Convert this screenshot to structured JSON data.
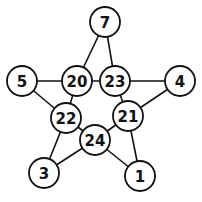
{
  "diagram": {
    "type": "star-graph",
    "nodes": [
      {
        "id": "n7",
        "label": "7",
        "x": 105,
        "y": 22,
        "r": 15
      },
      {
        "id": "n5",
        "label": "5",
        "x": 22,
        "y": 81,
        "r": 15
      },
      {
        "id": "n20",
        "label": "20",
        "x": 77,
        "y": 81,
        "r": 15
      },
      {
        "id": "n23",
        "label": "23",
        "x": 115,
        "y": 81,
        "r": 15
      },
      {
        "id": "n4",
        "label": "4",
        "x": 180,
        "y": 81,
        "r": 15
      },
      {
        "id": "n22",
        "label": "22",
        "x": 66,
        "y": 118,
        "r": 15
      },
      {
        "id": "n21",
        "label": "21",
        "x": 128,
        "y": 116,
        "r": 15
      },
      {
        "id": "n24",
        "label": "24",
        "x": 95,
        "y": 140,
        "r": 15
      },
      {
        "id": "n3",
        "label": "3",
        "x": 44,
        "y": 173,
        "r": 15
      },
      {
        "id": "n1",
        "label": "1",
        "x": 140,
        "y": 176,
        "r": 15
      }
    ],
    "edges": [
      [
        "n7",
        "n20"
      ],
      [
        "n7",
        "n23"
      ],
      [
        "n5",
        "n20"
      ],
      [
        "n5",
        "n22"
      ],
      [
        "n20",
        "n23"
      ],
      [
        "n23",
        "n4"
      ],
      [
        "n4",
        "n21"
      ],
      [
        "n23",
        "n21"
      ],
      [
        "n20",
        "n22"
      ],
      [
        "n22",
        "n24"
      ],
      [
        "n24",
        "n21"
      ],
      [
        "n22",
        "n3"
      ],
      [
        "n3",
        "n24"
      ],
      [
        "n24",
        "n1"
      ],
      [
        "n21",
        "n1"
      ]
    ],
    "colors": {
      "stroke": "#111111",
      "fill": "#ffffff"
    }
  }
}
